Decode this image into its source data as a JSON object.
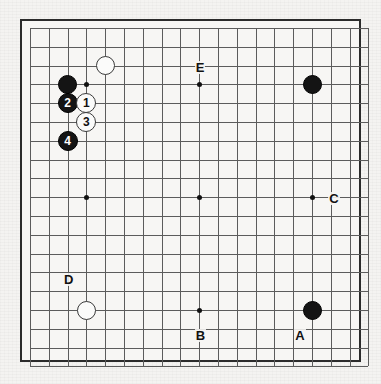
{
  "figure": {
    "kind": "go-board-diagram",
    "board_size": 19,
    "background_color": "#f4f3f1",
    "board_color": "#f7f6f4",
    "grid_color": "#5c5c5c",
    "border_color": "#2b2b2b",
    "black_color": "#141414",
    "white_color": "#fbfbfa"
  },
  "geometry": {
    "board_left": 20,
    "board_top": 19,
    "board_width": 341,
    "board_height": 343,
    "origin_x": 8,
    "origin_y": 7,
    "spacing": 18.8,
    "stone_diameter": 19,
    "numbered_stone_diameter": 20,
    "label_font_size": 13,
    "number_font_size": 12
  },
  "star_points": [
    {
      "name": "star-point-upper-left",
      "col": 3,
      "row": 3
    },
    {
      "name": "star-point-upper-middle",
      "col": 9,
      "row": 3
    },
    {
      "name": "star-point-upper-right",
      "col": 15,
      "row": 3
    },
    {
      "name": "star-point-middle-left",
      "col": 3,
      "row": 9
    },
    {
      "name": "star-point-tengen",
      "col": 9,
      "row": 9
    },
    {
      "name": "star-point-middle-right",
      "col": 15,
      "row": 9
    },
    {
      "name": "star-point-lower-left",
      "col": 3,
      "row": 15
    },
    {
      "name": "star-point-lower-middle",
      "col": 9,
      "row": 15
    },
    {
      "name": "star-point-lower-right",
      "col": 15,
      "row": 15
    }
  ],
  "stones": [
    {
      "name": "black-stone-upper-left-corner",
      "color": "black",
      "col": 2,
      "row": 3,
      "number": ""
    },
    {
      "name": "white-stone-upper-left-area",
      "color": "white",
      "col": 4,
      "row": 2,
      "number": ""
    },
    {
      "name": "black-stone-upper-right",
      "color": "black",
      "col": 15,
      "row": 3,
      "number": ""
    },
    {
      "name": "white-stone-lower-left",
      "color": "white",
      "col": 3,
      "row": 15,
      "number": ""
    },
    {
      "name": "black-stone-lower-right",
      "color": "black",
      "col": 15,
      "row": 15,
      "number": ""
    },
    {
      "name": "numbered-stone-2",
      "color": "black",
      "col": 2,
      "row": 4,
      "number": "2"
    },
    {
      "name": "numbered-stone-1",
      "color": "white",
      "col": 3,
      "row": 4,
      "number": "1"
    },
    {
      "name": "numbered-stone-3",
      "color": "white",
      "col": 3,
      "row": 5,
      "number": "3"
    },
    {
      "name": "numbered-stone-4",
      "color": "black",
      "col": 2,
      "row": 6,
      "number": "4"
    }
  ],
  "point_labels": [
    {
      "name": "point-label-e",
      "text": "E",
      "col": 9,
      "row": 2.15
    },
    {
      "name": "point-label-c",
      "text": "C",
      "col": 16.1,
      "row": 9.1
    },
    {
      "name": "point-label-d",
      "text": "D",
      "col": 2,
      "row": 13.4
    },
    {
      "name": "point-label-b",
      "text": "B",
      "col": 9,
      "row": 16.4
    },
    {
      "name": "point-label-a",
      "text": "A",
      "col": 14.3,
      "row": 16.4
    }
  ]
}
